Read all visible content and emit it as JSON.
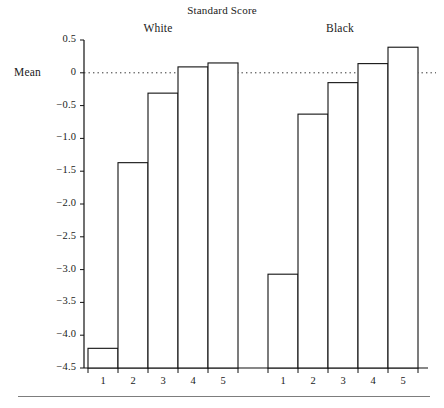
{
  "chart_data": {
    "type": "bar",
    "title": "Standard Score",
    "xlabel": "",
    "ylabel": "Mean",
    "ylim": [
      -4.5,
      0.5
    ],
    "ytick_labels": [
      "0.5",
      "0",
      "−0.5",
      "−1.0",
      "−1.5",
      "−2.0",
      "−2.5",
      "−3.0",
      "−3.5",
      "−4.0",
      "−4.5"
    ],
    "ytick_values": [
      0.5,
      0,
      -0.5,
      -1.0,
      -1.5,
      -2.0,
      -2.5,
      -3.0,
      -3.5,
      -4.0,
      -4.5
    ],
    "grid": false,
    "legend": "none",
    "zero_reference_line": true,
    "categories": [
      "1",
      "2",
      "3",
      "4",
      "5"
    ],
    "groups": [
      {
        "name": "White",
        "categories": [
          "1",
          "2",
          "3",
          "4",
          "5"
        ],
        "values": [
          -4.2,
          -1.37,
          -0.31,
          0.09,
          0.15
        ]
      },
      {
        "name": "Black",
        "categories": [
          "1",
          "2",
          "3",
          "4",
          "5"
        ],
        "values": [
          -3.07,
          -0.63,
          -0.15,
          0.14,
          0.39
        ]
      }
    ]
  },
  "labels": {
    "title": "Standard Score",
    "mean": "Mean",
    "group_white": "White",
    "group_black": "Black"
  }
}
